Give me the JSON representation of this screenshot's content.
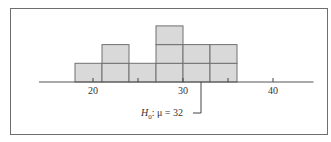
{
  "chart_data": {
    "type": "bar",
    "subtype": "histogram",
    "title": "",
    "xlabel": "",
    "ylabel": "",
    "bin_edges": [
      18,
      21,
      24,
      27,
      30,
      33,
      36
    ],
    "categories": [
      "18-21",
      "21-24",
      "24-27",
      "27-30",
      "30-33",
      "33-36"
    ],
    "values": [
      1,
      2,
      1,
      3,
      2,
      2
    ],
    "xlim": [
      12.4,
      38.8
    ],
    "x_axis_extent": [
      14,
      44.5
    ],
    "ylim": [
      0,
      3
    ],
    "xticks": [
      20,
      25,
      30,
      35,
      40
    ],
    "xtick_labels": [
      "20",
      "",
      "30",
      "",
      "40"
    ],
    "grid": false,
    "legend": null,
    "annotations": [
      {
        "text_parts": [
          "H",
          "0",
          ": μ = 32"
        ],
        "text": "H0: μ = 32",
        "x_value": 32,
        "pointer": "line from axis down to label"
      }
    ],
    "colors": {
      "bar_fill": "#d9d9d9",
      "bar_stroke": "#707070",
      "axis": "#555555",
      "frame": "#6e6e6e"
    }
  },
  "annotation": {
    "h": "H",
    "sub": "0",
    "rest": ": μ = 32"
  }
}
